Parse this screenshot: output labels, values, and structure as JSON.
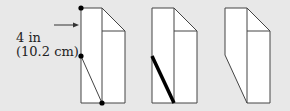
{
  "label": {
    "line1": "4 in",
    "line2": "(10.2 cm)"
  },
  "colors": {
    "background": "#e8e8e8",
    "stroke": "#333333",
    "fill": "#ffffff",
    "dot": "#000000"
  },
  "panels": [
    {
      "name": "step-1",
      "note": "fold marking with dots and guide line"
    },
    {
      "name": "step-2",
      "note": "bold fold line"
    },
    {
      "name": "step-3",
      "note": "folded corner result"
    }
  ]
}
